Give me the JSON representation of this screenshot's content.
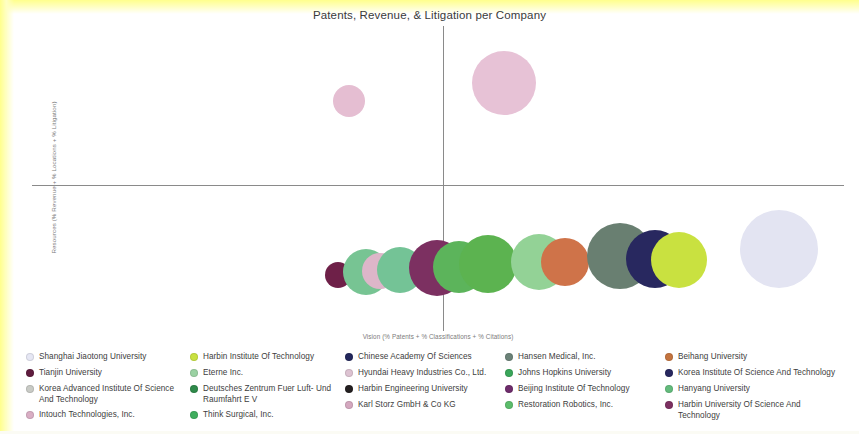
{
  "chart_data": {
    "type": "scatter",
    "title": "Patents, Revenue, & Litigation per Company",
    "xlabel": "Vision (% Patents + % Classifications + % Citations)",
    "ylabel": "Resources (% Revenue + % Locations + % Litigation)",
    "grid": false,
    "legend_position": "bottom",
    "axes": {
      "origin_x_px": 411,
      "origin_y_px": 159,
      "x_axis_visible": true,
      "y_axis_visible": true,
      "tick_labels_x": [],
      "tick_labels_y": []
    },
    "points": [
      {
        "name": "Karl Storz GmbH & Co KG",
        "x": 349,
        "y": 101,
        "r": 16,
        "color": "#e5bed2"
      },
      {
        "name": "Intouch Technologies, Inc.",
        "x": 504,
        "y": 83,
        "r": 32,
        "color": "#e7c2d6"
      },
      {
        "name": "Tianjin University",
        "x": 338,
        "y": 275,
        "r": 13,
        "color": "#6e2048"
      },
      {
        "name": "Hanyang University",
        "x": 366,
        "y": 272,
        "r": 23,
        "color": "#77c493"
      },
      {
        "name": "Karl Storz GmbH & Co KG (lower)",
        "x": 380,
        "y": 271,
        "r": 18,
        "color": "#ddb6c9"
      },
      {
        "name": "Johns Hopkins University",
        "x": 400,
        "y": 270,
        "r": 23,
        "color": "#74c396"
      },
      {
        "name": "Harbin University Of Science And Technology",
        "x": 437,
        "y": 268,
        "r": 28,
        "color": "#7c3061"
      },
      {
        "name": "Restoration Robotics, Inc.",
        "x": 459,
        "y": 267,
        "r": 26,
        "color": "#5cb45b"
      },
      {
        "name": "Think Surgical, Inc.",
        "x": 488,
        "y": 264,
        "r": 29,
        "color": "#5cb350"
      },
      {
        "name": "Eterne Inc.",
        "x": 539,
        "y": 262,
        "r": 28,
        "color": "#93d296"
      },
      {
        "name": "Beihang University",
        "x": 565,
        "y": 262,
        "r": 24,
        "color": "#cf7349"
      },
      {
        "name": "Hansen Medical, Inc.",
        "x": 620,
        "y": 256,
        "r": 33,
        "color": "#697f71"
      },
      {
        "name": "Korea Institute Of Science And Technology",
        "x": 655,
        "y": 259,
        "r": 29,
        "color": "#28285f"
      },
      {
        "name": "Harbin Institute Of Technology",
        "x": 679,
        "y": 260,
        "r": 28,
        "color": "#c9e140"
      },
      {
        "name": "Shanghai Jiaotong University",
        "x": 779,
        "y": 249,
        "r": 39,
        "color": "#e3e4f2"
      }
    ]
  },
  "legend": {
    "columns": [
      {
        "items": [
          {
            "label": "Shanghai Jiaotong University",
            "color": "#e6e7f4"
          },
          {
            "label": "Tianjin University",
            "color": "#5f1c3f"
          },
          {
            "label": "Korea Advanced Institute Of Science And Technology",
            "color": "#c9cbc6"
          },
          {
            "label": "Intouch Technologies, Inc.",
            "color": "#d9aec4"
          }
        ]
      },
      {
        "items": [
          {
            "label": "Harbin Institute Of Technology",
            "color": "#c9e140"
          },
          {
            "label": "Eterne Inc.",
            "color": "#9bd2a3"
          },
          {
            "label": "Deutsches Zentrum Fuer Luft- Und Raumfahrt E V",
            "color": "#2f8a4a"
          },
          {
            "label": "Think Surgical, Inc.",
            "color": "#3fae5e"
          }
        ]
      },
      {
        "items": [
          {
            "label": "Chinese Academy Of Sciences",
            "color": "#23275c"
          },
          {
            "label": "Hyundai Heavy Industries Co., Ltd.",
            "color": "#ddc3d2"
          },
          {
            "label": "Harbin Engineering University",
            "color": "#231f20"
          },
          {
            "label": "Karl Storz GmbH & Co KG",
            "color": "#d4a8bf"
          }
        ]
      },
      {
        "items": [
          {
            "label": "Hansen Medical, Inc.",
            "color": "#6b8278"
          },
          {
            "label": "Johns Hopkins University",
            "color": "#3aa65a"
          },
          {
            "label": "Beijing Institute Of Technology",
            "color": "#6e2c6b"
          },
          {
            "label": "Restoration Robotics, Inc.",
            "color": "#5cbd6b"
          }
        ]
      },
      {
        "items": [
          {
            "label": "Beihang University",
            "color": "#c4743f"
          },
          {
            "label": "Korea Institute Of Science And Technology",
            "color": "#28285f"
          },
          {
            "label": "Hanyang University",
            "color": "#63bb7c"
          },
          {
            "label": "Harbin University Of Science And Technology",
            "color": "#7c3061"
          }
        ]
      }
    ]
  }
}
